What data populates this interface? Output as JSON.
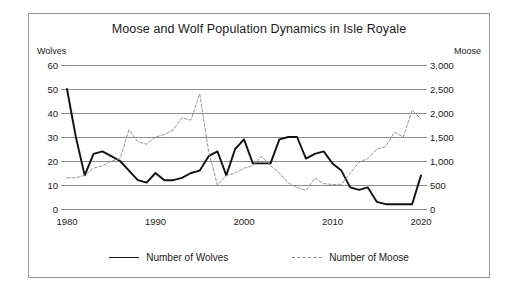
{
  "chart_data": {
    "type": "line",
    "title": "Moose and Wolf Population Dynamics in Isle Royale",
    "xlabel": "",
    "ylabel": "Wolves",
    "y2label": "Moose",
    "grid": true,
    "legend_position": "bottom",
    "xlim": [
      1980,
      2020
    ],
    "ylim": [
      0,
      60
    ],
    "y2lim": [
      0,
      3000
    ],
    "xticks": [
      1980,
      1990,
      2000,
      2010,
      2020
    ],
    "xtick_labels": [
      "1980",
      "1990",
      "2000",
      "2010",
      "2020"
    ],
    "yticks": [
      0,
      10,
      20,
      30,
      40,
      50,
      60
    ],
    "ytick_labels": [
      "0",
      "10",
      "20",
      "30",
      "40",
      "50",
      "60"
    ],
    "y2ticks": [
      0,
      500,
      1000,
      1500,
      2000,
      2500,
      3000
    ],
    "y2tick_labels": [
      "0",
      "500",
      "1,000",
      "1,500",
      "2,000",
      "2,500",
      "3,000"
    ],
    "x": [
      1980,
      1981,
      1982,
      1983,
      1984,
      1985,
      1986,
      1987,
      1988,
      1989,
      1990,
      1991,
      1992,
      1993,
      1994,
      1995,
      1996,
      1997,
      1998,
      1999,
      2000,
      2001,
      2002,
      2003,
      2004,
      2005,
      2006,
      2007,
      2008,
      2009,
      2010,
      2011,
      2012,
      2013,
      2014,
      2015,
      2016,
      2017,
      2018,
      2019,
      2020
    ],
    "series": [
      {
        "name": "Number of Wolves",
        "axis": "left",
        "style": "solid",
        "color": "#111111",
        "values": [
          50,
          30,
          14,
          23,
          24,
          22,
          20,
          16,
          12,
          11,
          15,
          12,
          12,
          13,
          15,
          16,
          22,
          24,
          14,
          25,
          29,
          19,
          19,
          19,
          29,
          30,
          30,
          21,
          23,
          24,
          19,
          16,
          9,
          8,
          9,
          3,
          2,
          2,
          2,
          2,
          14
        ]
      },
      {
        "name": "Number of Moose",
        "axis": "right",
        "style": "dashed",
        "color": "#8a8a8a",
        "values": [
          650,
          650,
          700,
          850,
          900,
          1000,
          1050,
          1650,
          1400,
          1350,
          1500,
          1550,
          1650,
          1900,
          1850,
          2400,
          1200,
          500,
          700,
          750,
          850,
          900,
          1100,
          900,
          750,
          540,
          450,
          385,
          650,
          530,
          510,
          515,
          750,
          975,
          1050,
          1250,
          1300,
          1600,
          1500,
          2060,
          1875
        ]
      }
    ]
  },
  "figure": {
    "title": "Moose and Wolf Population Dynamics in Isle Royale",
    "left_axis_caption": "Wolves",
    "right_axis_caption": "Moose"
  },
  "legend": {
    "items": [
      {
        "label": "Number of Wolves",
        "style": "solid"
      },
      {
        "label": "Number of Moose",
        "style": "dashed"
      }
    ]
  }
}
